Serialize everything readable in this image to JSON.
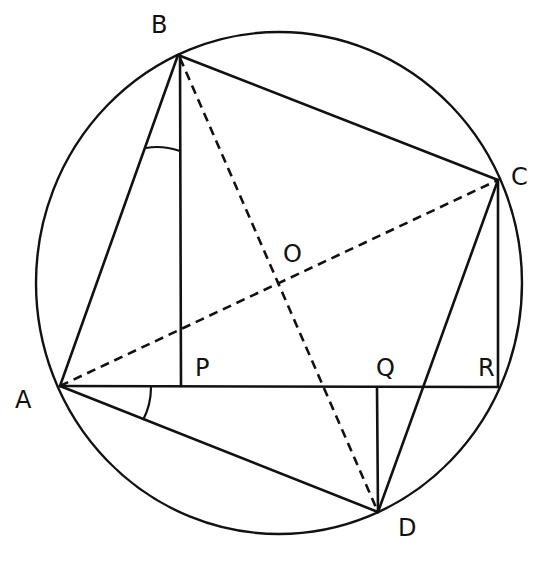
{
  "figure": {
    "type": "cyclic quadrilateral with perpendiculars",
    "circle": {
      "cx": 279,
      "cy": 283,
      "rx": 243,
      "ry": 251
    },
    "colors": {
      "ink": "#111111",
      "background": "#ffffff"
    },
    "points": {
      "A": {
        "x": 60,
        "y": 386
      },
      "B": {
        "x": 178,
        "y": 55
      },
      "C": {
        "x": 498,
        "y": 180
      },
      "D": {
        "x": 378,
        "y": 512
      },
      "O": {
        "x": 277,
        "y": 283
      },
      "P": {
        "x": 181,
        "y": 386
      },
      "Q": {
        "x": 377,
        "y": 387
      },
      "R": {
        "x": 498,
        "y": 387
      }
    },
    "labels": {
      "A": "A",
      "B": "B",
      "C": "C",
      "D": "D",
      "O": "O",
      "P": "P",
      "Q": "Q",
      "R": "R"
    },
    "solid_segments": [
      "AB",
      "BC",
      "CD",
      "DA",
      "AR",
      "BP",
      "DQ",
      "CR"
    ],
    "dashed_segments": [
      "AC",
      "BD"
    ],
    "marked_angles": [
      "ABP",
      "PAD"
    ]
  }
}
